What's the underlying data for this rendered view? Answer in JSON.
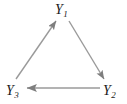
{
  "diagram": {
    "type": "directed-cycle-graph",
    "title": "",
    "background_color": "#ffffff",
    "edge_color": "#9a9a9a",
    "label_color": "#1a1a1a",
    "nodes": [
      {
        "id": "Y1",
        "base": "Y",
        "subscript": "1",
        "label": "Y1",
        "position": "top",
        "x": 62,
        "y": 11
      },
      {
        "id": "Y2",
        "base": "Y",
        "subscript": "2",
        "label": "Y2",
        "position": "bottom-right",
        "x": 110,
        "y": 90
      },
      {
        "id": "Y3",
        "base": "Y",
        "subscript": "3",
        "label": "Y3",
        "position": "bottom-left",
        "x": 13,
        "y": 90
      }
    ],
    "edges": [
      {
        "id": "edge-y3-y1",
        "from": "Y3",
        "to": "Y1",
        "arrowhead": "at-target",
        "direction": "up-right",
        "x1": 16,
        "y1": 79,
        "x2": 56,
        "y2": 21
      },
      {
        "id": "edge-y1-y2",
        "from": "Y1",
        "to": "Y2",
        "arrowhead": "at-target",
        "direction": "down-right",
        "x1": 69,
        "y1": 21,
        "x2": 104,
        "y2": 79
      },
      {
        "id": "edge-y2-y3",
        "from": "Y2",
        "to": "Y3",
        "arrowhead": "at-target",
        "direction": "left",
        "x1": 100,
        "y1": 88,
        "x2": 27,
        "y2": 88
      }
    ]
  }
}
